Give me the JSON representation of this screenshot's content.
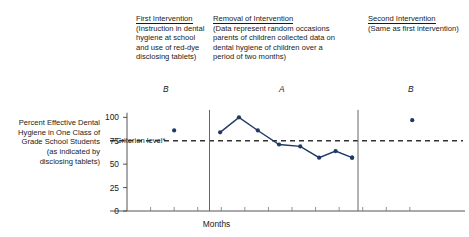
{
  "annotations": {
    "first": {
      "heading": "First Intervention",
      "body": "(Instruction in dental hygiene at school and use of red-dye disclosing tablets)"
    },
    "removal": {
      "heading": "Removal of Intervention",
      "body": "(Data represent random occasions parents of children collected data on dental hygiene of children over a period of two months)"
    },
    "second": {
      "heading": "Second Intervention",
      "body": "(Same as first intervention)"
    }
  },
  "phase_letters": {
    "first": "B",
    "middle": "A",
    "last": "B"
  },
  "criterion_label": "Criterion level*",
  "chart_data": {
    "type": "line",
    "title": "",
    "xlabel": "Months",
    "ylabel": "Percent Effective Dental Hygiene in One Class of Grade School Students (as indicated by disclosing tablets)",
    "ylim": [
      0,
      110
    ],
    "yticks": [
      0,
      25,
      50,
      75,
      100
    ],
    "ytick_labels": [
      "0",
      "25",
      "50",
      "75",
      "100"
    ],
    "xlim": [
      0,
      14
    ],
    "grid": false,
    "legend": null,
    "point_color": "#1F3864",
    "line_color": "#1F3864",
    "criterion_line": {
      "value": 75,
      "style": "dashed",
      "color": "#333333"
    },
    "phase_dividers": [
      3.5,
      9.8
    ],
    "phase_labels": [
      {
        "label": "B",
        "x": 2.0
      },
      {
        "label": "A",
        "x": 6.6
      },
      {
        "label": "B",
        "x": 12.1
      }
    ],
    "series": [
      {
        "name": "B (first intervention)",
        "phase": "B",
        "connected": false,
        "points": [
          {
            "x": 2.0,
            "y": 86
          }
        ]
      },
      {
        "name": "A (removal of intervention)",
        "phase": "A",
        "connected": true,
        "points": [
          {
            "x": 3.95,
            "y": 84
          },
          {
            "x": 4.75,
            "y": 100
          },
          {
            "x": 5.55,
            "y": 86
          },
          {
            "x": 6.45,
            "y": 71
          },
          {
            "x": 7.35,
            "y": 69
          },
          {
            "x": 8.15,
            "y": 57
          },
          {
            "x": 8.85,
            "y": 64
          },
          {
            "x": 9.55,
            "y": 57
          },
          {
            "x": 9.55,
            "y": 57
          }
        ]
      },
      {
        "name": "B (second intervention)",
        "phase": "B",
        "connected": false,
        "points": [
          {
            "x": 12.1,
            "y": 97
          }
        ]
      }
    ]
  }
}
